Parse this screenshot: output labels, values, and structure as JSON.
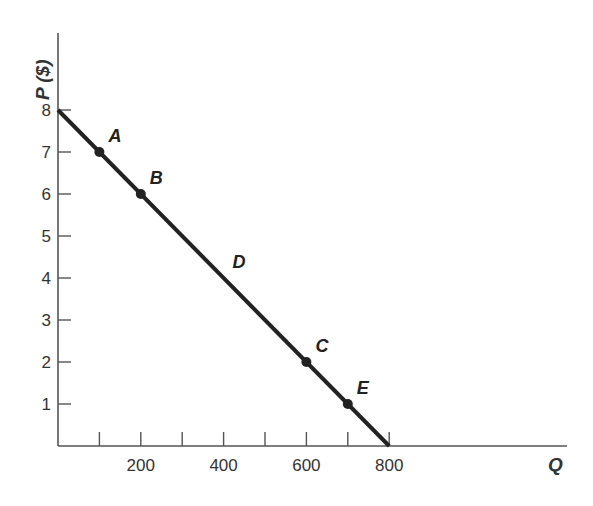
{
  "chart_data": {
    "type": "line",
    "title": "",
    "xlabel": "Q",
    "ylabel": "P ($)",
    "xlim": [
      0,
      1000
    ],
    "ylim": [
      0,
      8
    ],
    "grid": false,
    "legend": null,
    "x_ticks": [
      100,
      200,
      300,
      400,
      500,
      600,
      700,
      800
    ],
    "x_tick_labels": [
      {
        "value": 200,
        "label": "200"
      },
      {
        "value": 400,
        "label": "400"
      },
      {
        "value": 600,
        "label": "600"
      },
      {
        "value": 800,
        "label": "800"
      }
    ],
    "y_ticks": [
      1,
      2,
      3,
      4,
      5,
      6,
      7,
      8
    ],
    "y_tick_labels": [
      "1",
      "2",
      "3",
      "4",
      "5",
      "6",
      "7",
      "8"
    ],
    "series": [
      {
        "name": "Demand",
        "x": [
          0,
          800
        ],
        "y": [
          8,
          0
        ],
        "color": "#222222"
      }
    ],
    "annotations": [
      {
        "label": "A",
        "x": 100,
        "y": 7,
        "marker": true
      },
      {
        "label": "B",
        "x": 200,
        "y": 6,
        "marker": true
      },
      {
        "label": "D",
        "x": 400,
        "y": 4,
        "marker": false
      },
      {
        "label": "C",
        "x": 600,
        "y": 2,
        "marker": true
      },
      {
        "label": "E",
        "x": 700,
        "y": 1,
        "marker": true
      }
    ]
  }
}
